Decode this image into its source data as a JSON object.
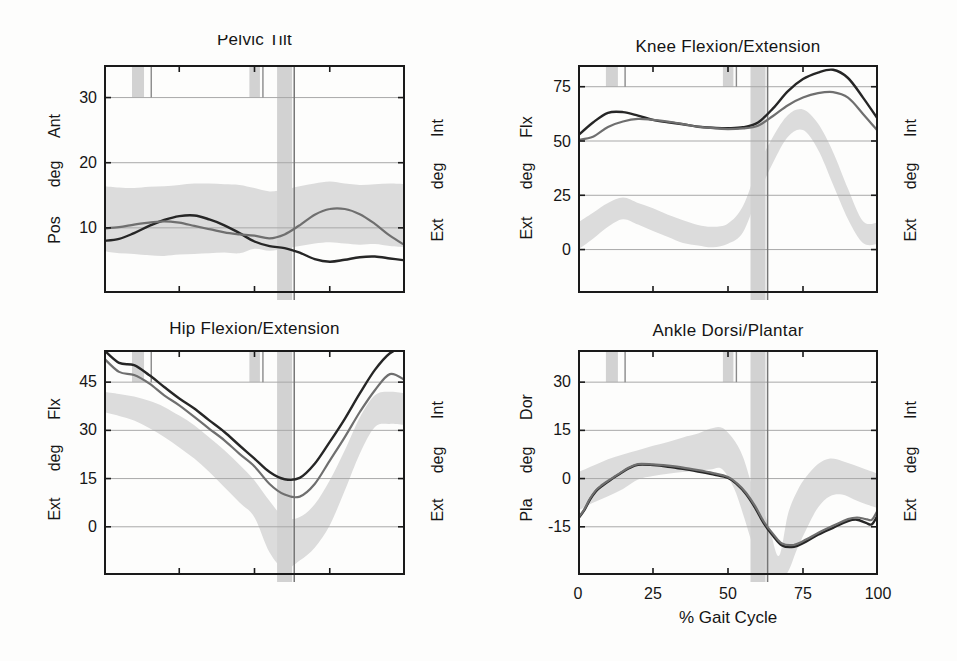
{
  "figure": {
    "gait_events": {
      "band1": [
        9.3,
        13.3
      ],
      "line1": 15.7,
      "band2": [
        48.3,
        51.8
      ],
      "line2": 52.8,
      "foot_off_band": [
        57.5,
        62.5
      ],
      "foot_off_line": 63.2
    }
  },
  "palette": {
    "curve_dark": "#262626",
    "curve_gray": "#6f6f6f",
    "normal_band": "#dcdcdc",
    "event_band": "#d2d2d2",
    "event_line": "#8a8a8a",
    "toeoff_line": "#767676",
    "gridline": "#a9a9a9",
    "frame": "#1a1a1a"
  },
  "chart_data": [
    {
      "id": "pelvic",
      "type": "line",
      "title": "Pelvic Tilt",
      "xlim": [
        0,
        100
      ],
      "ylim": [
        0,
        35
      ],
      "yticks": [
        10,
        20,
        30
      ],
      "ytick_labels": [
        "30",
        "20",
        "10"
      ],
      "left_axis_labels": [
        "Ant",
        "deg",
        "Pos"
      ],
      "right_axis_labels": [
        "Int",
        "deg",
        "Ext"
      ],
      "band": {
        "x": [
          0,
          5,
          10,
          15,
          20,
          25,
          30,
          35,
          40,
          45,
          50,
          55,
          60,
          65,
          70,
          75,
          80,
          85,
          90,
          95,
          100
        ],
        "upper": [
          16.4,
          16.2,
          16.1,
          16.3,
          16.4,
          16.6,
          16.8,
          16.8,
          16.7,
          16.6,
          16.1,
          15.6,
          15.9,
          16.4,
          16.8,
          17.1,
          16.8,
          16.6,
          16.7,
          16.8,
          16.7
        ],
        "lower": [
          6.4,
          6.1,
          6.0,
          5.8,
          5.7,
          5.9,
          6.0,
          6.1,
          6.2,
          6.1,
          6.8,
          6.5,
          6.8,
          7.2,
          7.6,
          7.8,
          7.6,
          7.4,
          7.5,
          7.2,
          7.0
        ]
      },
      "series": [
        {
          "name": "dark_curve",
          "color": "curve_dark",
          "width": 2.4,
          "x": [
            0,
            5,
            10,
            15,
            20,
            25,
            30,
            35,
            40,
            45,
            50,
            55,
            60,
            65,
            70,
            75,
            80,
            85,
            90,
            95,
            100
          ],
          "y": [
            8.0,
            8.3,
            9.2,
            10.3,
            11.2,
            11.8,
            11.9,
            11.3,
            10.4,
            9.2,
            7.9,
            7.2,
            6.9,
            6.2,
            5.2,
            4.8,
            5.1,
            5.5,
            5.6,
            5.3,
            5.0
          ]
        },
        {
          "name": "gray_curve",
          "color": "curve_gray",
          "width": 2.2,
          "x": [
            0,
            5,
            10,
            15,
            20,
            25,
            30,
            35,
            40,
            45,
            50,
            55,
            60,
            65,
            70,
            75,
            80,
            85,
            90,
            95,
            100
          ],
          "y": [
            9.9,
            10.1,
            10.5,
            10.8,
            11.0,
            10.8,
            10.3,
            9.8,
            9.3,
            9.0,
            8.8,
            8.4,
            9.0,
            10.4,
            12.0,
            12.9,
            12.9,
            12.1,
            10.6,
            8.8,
            7.3
          ]
        }
      ]
    },
    {
      "id": "knee",
      "type": "line",
      "title": "Knee Flexion/Extension",
      "xlim": [
        0,
        100
      ],
      "ylim": [
        -20,
        85
      ],
      "yticks": [
        0,
        25,
        50,
        75
      ],
      "ytick_labels": [
        "75",
        "50",
        "25",
        "0"
      ],
      "left_axis_labels": [
        "Flx",
        "deg",
        "Ext"
      ],
      "right_axis_labels": [
        "Int",
        "deg",
        "Ext"
      ],
      "band": {
        "x": [
          0,
          5,
          10,
          15,
          20,
          25,
          30,
          35,
          40,
          45,
          50,
          55,
          60,
          65,
          70,
          75,
          80,
          85,
          90,
          95,
          100
        ],
        "upper": [
          12.5,
          17.0,
          21.5,
          24.0,
          21.5,
          19.0,
          16.0,
          13.5,
          11.3,
          10.5,
          12.0,
          20.0,
          38.0,
          52.0,
          62.0,
          64.5,
          58.0,
          45.0,
          28.0,
          13.0,
          12.5
        ],
        "lower": [
          0.0,
          5.0,
          10.5,
          14.0,
          11.5,
          8.5,
          5.8,
          3.0,
          1.9,
          1.1,
          2.7,
          8.0,
          25.0,
          40.0,
          52.0,
          55.0,
          46.0,
          30.0,
          14.0,
          3.0,
          2.5
        ]
      },
      "series": [
        {
          "name": "dark_curve",
          "color": "curve_dark",
          "width": 2.4,
          "x": [
            0,
            5,
            10,
            15,
            20,
            25,
            30,
            35,
            40,
            45,
            50,
            55,
            60,
            65,
            70,
            75,
            80,
            85,
            90,
            95,
            100
          ],
          "y": [
            52.5,
            58.5,
            63.0,
            63.3,
            61.7,
            59.7,
            58.6,
            57.7,
            56.6,
            56.1,
            55.9,
            56.3,
            58.5,
            65.0,
            73.0,
            78.5,
            81.5,
            82.8,
            79.0,
            70.0,
            60.0
          ]
        },
        {
          "name": "gray_curve",
          "color": "curve_gray",
          "width": 2.2,
          "x": [
            0,
            5,
            10,
            15,
            20,
            25,
            30,
            35,
            40,
            45,
            50,
            55,
            60,
            65,
            70,
            75,
            80,
            85,
            90,
            95,
            100
          ],
          "y": [
            50.5,
            52.0,
            56.5,
            59.0,
            60.2,
            59.7,
            58.9,
            57.8,
            56.6,
            55.9,
            55.5,
            55.8,
            57.0,
            61.5,
            66.5,
            70.0,
            72.0,
            72.5,
            70.0,
            62.5,
            54.5
          ]
        }
      ]
    },
    {
      "id": "hip",
      "type": "line",
      "title": "Hip Flexion/Extension",
      "xlim": [
        0,
        100
      ],
      "ylim": [
        -15,
        55
      ],
      "yticks": [
        0,
        15,
        30,
        45
      ],
      "ytick_labels": [
        "45",
        "30",
        "15",
        "0"
      ],
      "left_axis_labels": [
        "Flx",
        "deg",
        "Ext"
      ],
      "right_axis_labels": [
        "Int",
        "deg",
        "Ext"
      ],
      "band": {
        "x": [
          0,
          5,
          10,
          15,
          20,
          25,
          30,
          35,
          40,
          45,
          50,
          55,
          60,
          65,
          70,
          75,
          80,
          85,
          90,
          95,
          100
        ],
        "upper": [
          42.0,
          41.3,
          40.5,
          39.2,
          37.3,
          34.6,
          31.6,
          27.8,
          23.8,
          19.3,
          14.4,
          8.0,
          2.8,
          3.0,
          7.0,
          14.5,
          23.8,
          34.0,
          40.9,
          42.0,
          41.5
        ],
        "lower": [
          35.7,
          34.5,
          33.1,
          30.7,
          27.9,
          24.7,
          21.2,
          17.0,
          12.3,
          7.6,
          2.9,
          -8.0,
          -13.0,
          -10.5,
          -6.5,
          0.5,
          11.3,
          22.7,
          31.0,
          32.0,
          31.6
        ]
      },
      "series": [
        {
          "name": "dark_curve",
          "color": "curve_dark",
          "width": 2.4,
          "x": [
            0,
            5,
            10,
            15,
            20,
            25,
            30,
            35,
            40,
            45,
            50,
            55,
            60,
            65,
            70,
            75,
            80,
            85,
            90,
            95,
            100
          ],
          "y": [
            55.0,
            51.0,
            50.3,
            47.2,
            43.5,
            39.9,
            36.8,
            33.1,
            29.5,
            25.3,
            21.2,
            17.0,
            14.8,
            15.2,
            19.6,
            26.4,
            33.6,
            41.5,
            48.8,
            54.0,
            56.0
          ]
        },
        {
          "name": "gray_curve",
          "color": "curve_gray",
          "width": 2.2,
          "x": [
            0,
            5,
            10,
            15,
            20,
            25,
            30,
            35,
            40,
            45,
            50,
            55,
            60,
            65,
            70,
            75,
            80,
            85,
            90,
            95,
            100
          ],
          "y": [
            52.4,
            48.2,
            47.2,
            44.6,
            40.9,
            37.8,
            34.2,
            30.5,
            26.9,
            22.7,
            18.8,
            13.3,
            10.0,
            9.4,
            13.3,
            20.6,
            27.9,
            35.7,
            42.5,
            47.5,
            45.6
          ]
        }
      ]
    },
    {
      "id": "ankle",
      "type": "line",
      "title": "Ankle Dorsi/Plantar",
      "xlim": [
        0,
        100
      ],
      "ylim": [
        -30,
        40
      ],
      "yticks": [
        -15,
        0,
        15,
        30
      ],
      "ytick_labels": [
        "30",
        "15",
        "0",
        "-15"
      ],
      "left_axis_labels": [
        "Dor",
        "deg",
        "Pla"
      ],
      "right_axis_labels": [
        "Int",
        "deg",
        "Ext"
      ],
      "xlabel": "% Gait Cycle",
      "xtick_labels": [
        "0",
        "25",
        "50",
        "75",
        "100"
      ],
      "band": {
        "x": [
          0,
          5,
          10,
          15,
          20,
          25,
          30,
          35,
          40,
          44,
          48,
          52,
          55,
          58,
          61,
          64,
          67,
          70,
          73,
          76,
          80,
          84,
          88,
          92,
          96,
          100
        ],
        "upper": [
          2.0,
          4.0,
          6.0,
          7.5,
          8.8,
          10.2,
          11.4,
          12.8,
          14.0,
          15.5,
          15.8,
          12.0,
          6.7,
          -2.0,
          -8.0,
          -16.0,
          -24.0,
          -11.0,
          -4.0,
          0.5,
          4.5,
          6.2,
          5.5,
          4.2,
          2.8,
          1.5
        ],
        "lower": [
          -10.0,
          -7.5,
          -5.5,
          -3.2,
          -0.3,
          0.8,
          1.5,
          2.0,
          2.5,
          2.8,
          3.0,
          -3.0,
          -11.0,
          -20.0,
          -28.0,
          -31.5,
          -31.5,
          -29.0,
          -22.0,
          -16.0,
          -9.0,
          -5.5,
          -5.0,
          -6.5,
          -8.0,
          -9.2
        ]
      },
      "series": [
        {
          "name": "dark_curve",
          "color": "curve_dark",
          "width": 2.4,
          "x": [
            0,
            2,
            4,
            6,
            8,
            11,
            14,
            17,
            20,
            25,
            30,
            35,
            40,
            45,
            50,
            53,
            56,
            59,
            62,
            65,
            68,
            72,
            76,
            80,
            85,
            90,
            93,
            96,
            98,
            100
          ],
          "y": [
            -12.5,
            -10.0,
            -6.5,
            -3.9,
            -2.3,
            -0.3,
            1.5,
            3.2,
            4.3,
            4.2,
            3.7,
            3.0,
            2.2,
            1.3,
            0.2,
            -1.8,
            -4.8,
            -9.0,
            -14.0,
            -17.8,
            -20.8,
            -21.2,
            -19.6,
            -17.5,
            -15.3,
            -13.2,
            -12.8,
            -13.8,
            -14.2,
            -11.2
          ]
        },
        {
          "name": "gray_curve",
          "color": "curve_gray",
          "width": 2.2,
          "x": [
            0,
            2,
            4,
            6,
            8,
            11,
            14,
            17,
            20,
            25,
            30,
            35,
            40,
            45,
            50,
            53,
            56,
            59,
            62,
            65,
            68,
            72,
            76,
            80,
            85,
            90,
            93,
            96,
            98,
            100
          ],
          "y": [
            -12.3,
            -9.7,
            -6.2,
            -3.6,
            -2.0,
            -0.1,
            1.7,
            3.4,
            4.5,
            4.4,
            4.0,
            3.4,
            2.6,
            1.7,
            0.5,
            -1.5,
            -4.4,
            -8.5,
            -13.5,
            -17.2,
            -20.2,
            -20.6,
            -19.0,
            -16.9,
            -14.7,
            -12.6,
            -12.1,
            -12.6,
            -12.8,
            -9.7
          ]
        }
      ]
    }
  ]
}
